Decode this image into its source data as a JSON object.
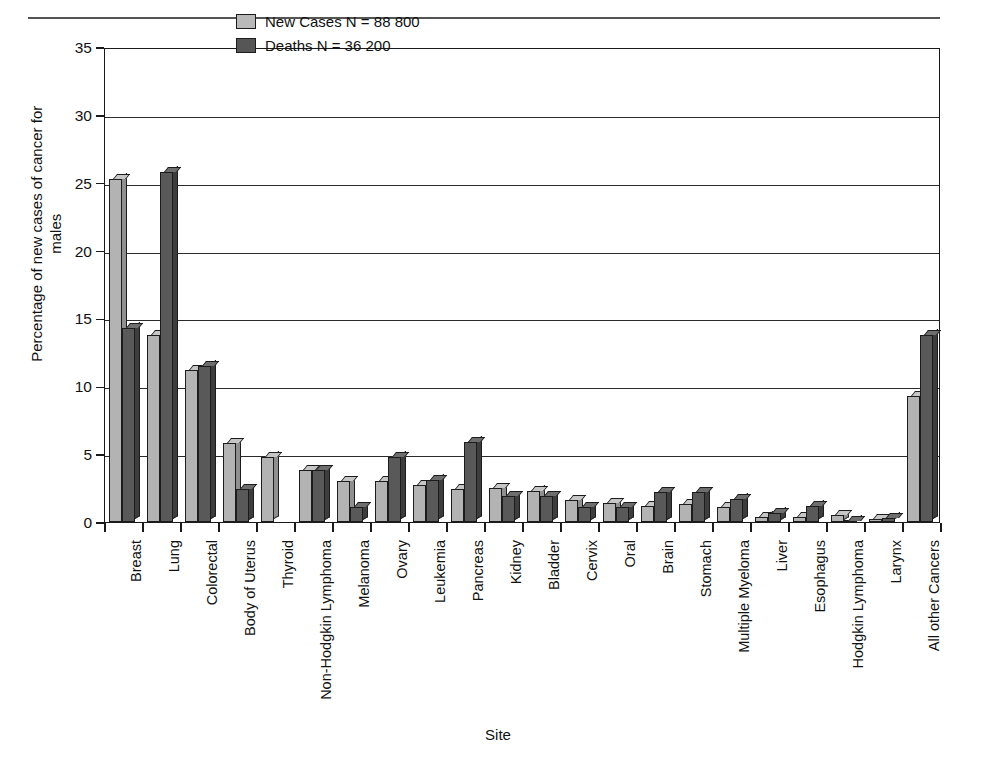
{
  "page": {
    "running_head": ""
  },
  "legend": {
    "position": "top-left-inside",
    "entries": [
      {
        "label": "New Cases N = 88 800",
        "swatch": "light"
      },
      {
        "label": "Deaths N = 36 200",
        "swatch": "dark"
      }
    ]
  },
  "colors": {
    "light_bar": "#b3b3b3",
    "dark_bar": "#595959",
    "axis": "#1a1a1a",
    "background": "#ffffff"
  },
  "chart_data": {
    "type": "bar",
    "title": "",
    "xlabel": "Site",
    "ylabel": "Percentage of new cases of cancer for males",
    "ylim": [
      0,
      35
    ],
    "yticks": [
      0,
      5,
      10,
      15,
      20,
      25,
      30,
      35
    ],
    "grid": true,
    "categories": [
      "Breast",
      "Lung",
      "Colorectal",
      "Body of Uterus",
      "Thyroid",
      "Non-Hodgkin Lymphoma",
      "Melanoma",
      "Ovary",
      "Leukemia",
      "Pancreas",
      "Kidney",
      "Bladder",
      "Cervix",
      "Oral",
      "Brain",
      "Stomach",
      "Multiple Myeloma",
      "Liver",
      "Esophagus",
      "Hodgkin Lymphoma",
      "Larynx",
      "All other Cancers"
    ],
    "series": [
      {
        "name": "New Cases N = 88 800",
        "values": [
          25.3,
          13.8,
          11.2,
          5.8,
          4.8,
          3.8,
          3.0,
          3.0,
          2.7,
          2.4,
          2.5,
          2.3,
          1.6,
          1.4,
          1.2,
          1.3,
          1.1,
          0.4,
          0.4,
          0.5,
          0.2,
          9.3
        ]
      },
      {
        "name": "Deaths N = 36 200",
        "values": [
          14.3,
          25.8,
          11.5,
          2.4,
          0.0,
          3.8,
          1.1,
          4.8,
          3.1,
          5.9,
          1.9,
          1.9,
          1.1,
          1.1,
          2.2,
          2.2,
          1.7,
          0.7,
          1.2,
          0.1,
          0.3,
          13.8
        ]
      }
    ]
  }
}
